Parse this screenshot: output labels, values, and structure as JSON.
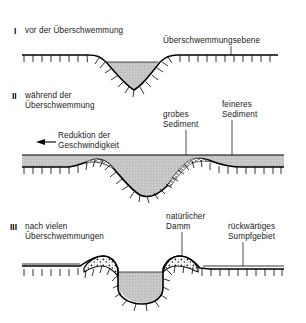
{
  "figure": {
    "title_panels": [
      {
        "numeral": "I",
        "caption": "vor der Überschwemmung",
        "annotations": [
          {
            "name": "floodplain",
            "text": "Überschwemmungsebene"
          }
        ]
      },
      {
        "numeral": "II",
        "caption_line1": "während der",
        "caption_line2": "Überschwemmung",
        "annotations": [
          {
            "name": "velocity-reduction",
            "line1": "Reduktion der",
            "line2": "Geschwindigkeit"
          },
          {
            "name": "coarse-sediment",
            "line1": "grobes",
            "line2": "Sediment"
          },
          {
            "name": "fine-sediment",
            "line1": "feineres",
            "line2": "Sediment"
          }
        ]
      },
      {
        "numeral": "III",
        "caption_line1": "nach vielen",
        "caption_line2": "Überschwemmungen",
        "annotations": [
          {
            "name": "natural-levee",
            "line1": "natürlicher",
            "line2": "Damm"
          },
          {
            "name": "backswamp",
            "line1": "rückwärtiges",
            "line2": "Sumpfgebiet"
          }
        ]
      }
    ],
    "colors": {
      "water_fill": "#c6c6c6",
      "line": "#000000",
      "text": "#1a1a1a",
      "levee_fill": "#ffffff",
      "background": "#ffffff"
    },
    "arrow": {
      "name": "flow-direction-arrow",
      "direction": "left"
    }
  }
}
